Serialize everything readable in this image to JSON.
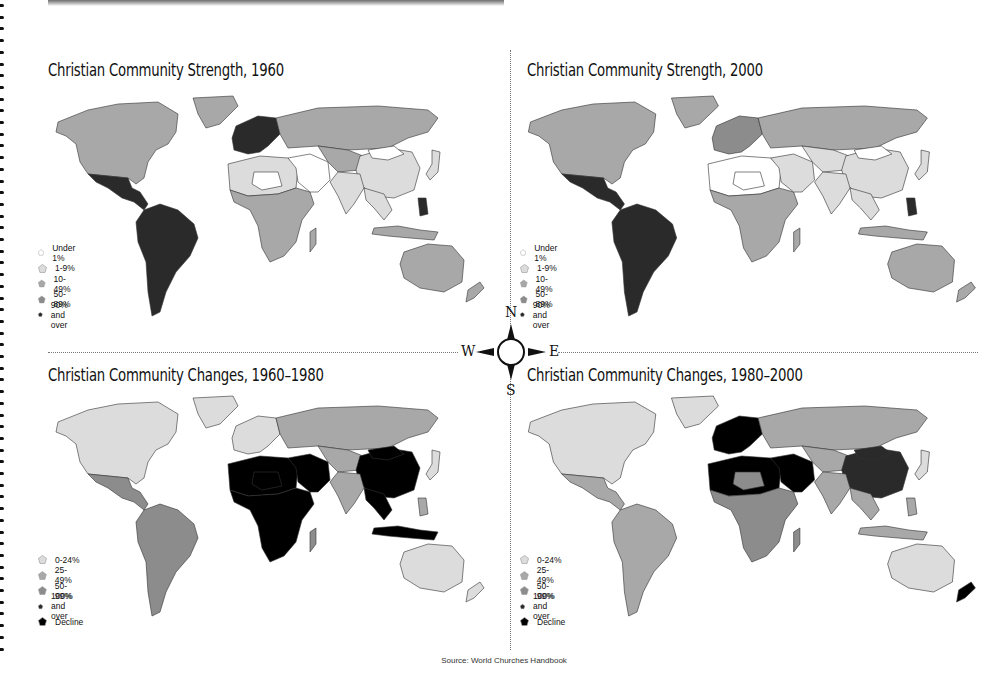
{
  "colors": {
    "under1": "#ffffff",
    "light": "#dcdcdc",
    "mid": "#a8a8a8",
    "midDark": "#8c8c8c",
    "dark": "#2a2a2a",
    "black": "#000000",
    "border": "#333333"
  },
  "panels": [
    {
      "id": "strength-1960",
      "title": "Christian Community Strength, 1960",
      "legend": [
        {
          "label": "Under 1%",
          "color": "#ffffff"
        },
        {
          "label": "1-9%",
          "color": "#dcdcdc"
        },
        {
          "label": "10-49%",
          "color": "#a8a8a8"
        },
        {
          "label": "50-89%",
          "color": "#8c8c8c"
        },
        {
          "label": "90% and over",
          "color": "#2a2a2a"
        }
      ]
    },
    {
      "id": "strength-2000",
      "title": "Christian Community Strength, 2000",
      "legend": [
        {
          "label": "Under 1%",
          "color": "#ffffff"
        },
        {
          "label": "1-9%",
          "color": "#dcdcdc"
        },
        {
          "label": "10-49%",
          "color": "#a8a8a8"
        },
        {
          "label": "50-89%",
          "color": "#8c8c8c"
        },
        {
          "label": "90% and over",
          "color": "#2a2a2a"
        }
      ]
    },
    {
      "id": "changes-1960-1980",
      "title": "Christian Community Changes, 1960–1980",
      "legend": [
        {
          "label": "0-24%",
          "color": "#dcdcdc"
        },
        {
          "label": "25-49%",
          "color": "#a8a8a8"
        },
        {
          "label": "50-99%",
          "color": "#8c8c8c"
        },
        {
          "label": "100% and over",
          "color": "#2a2a2a"
        },
        {
          "label": "Decline",
          "color": "#000000"
        }
      ]
    },
    {
      "id": "changes-1980-2000",
      "title": "Christian Community Changes, 1980–2000",
      "legend": [
        {
          "label": "0-24%",
          "color": "#dcdcdc"
        },
        {
          "label": "25-49%",
          "color": "#a8a8a8"
        },
        {
          "label": "50-99%",
          "color": "#8c8c8c"
        },
        {
          "label": "100% and over",
          "color": "#2a2a2a"
        },
        {
          "label": "Decline",
          "color": "#000000"
        }
      ]
    }
  ],
  "compass": {
    "n": "N",
    "s": "S",
    "e": "E",
    "w": "W"
  },
  "source": "Source: World Churches Handbook",
  "regions_by_panel": {
    "strength-1960": {
      "north_america": "#a8a8a8",
      "greenland": "#a8a8a8",
      "mexico_central": "#2a2a2a",
      "south_america": "#2a2a2a",
      "western_europe": "#2a2a2a",
      "russia": "#a8a8a8",
      "north_africa": "#dcdcdc",
      "sahara_center": "#ffffff",
      "sub_saharan_africa": "#a8a8a8",
      "middle_east": "#ffffff",
      "central_asia": "#a8a8a8",
      "china": "#dcdcdc",
      "mongolia": "#ffffff",
      "india": "#dcdcdc",
      "southeast_asia": "#dcdcdc",
      "indonesia": "#a8a8a8",
      "philippines": "#2a2a2a",
      "australia": "#a8a8a8",
      "new_zealand": "#a8a8a8",
      "madagascar": "#a8a8a8",
      "japan": "#dcdcdc"
    },
    "strength-2000": {
      "north_america": "#a8a8a8",
      "greenland": "#a8a8a8",
      "mexico_central": "#2a2a2a",
      "south_america": "#2a2a2a",
      "western_europe": "#8c8c8c",
      "russia": "#a8a8a8",
      "north_africa": "#ffffff",
      "sahara_center": "#ffffff",
      "sub_saharan_africa": "#a8a8a8",
      "middle_east": "#dcdcdc",
      "central_asia": "#dcdcdc",
      "china": "#dcdcdc",
      "mongolia": "#ffffff",
      "india": "#dcdcdc",
      "southeast_asia": "#dcdcdc",
      "indonesia": "#a8a8a8",
      "philippines": "#2a2a2a",
      "australia": "#a8a8a8",
      "new_zealand": "#a8a8a8",
      "madagascar": "#a8a8a8",
      "japan": "#dcdcdc"
    },
    "changes-1960-1980": {
      "north_america": "#dcdcdc",
      "greenland": "#dcdcdc",
      "mexico_central": "#8c8c8c",
      "south_america": "#8c8c8c",
      "western_europe": "#dcdcdc",
      "russia": "#a8a8a8",
      "north_africa": "#000000",
      "sahara_center": "#000000",
      "sub_saharan_africa": "#000000",
      "middle_east": "#000000",
      "central_asia": "#a8a8a8",
      "china": "#000000",
      "mongolia": "#000000",
      "india": "#a8a8a8",
      "southeast_asia": "#000000",
      "indonesia": "#000000",
      "philippines": "#a8a8a8",
      "australia": "#dcdcdc",
      "new_zealand": "#dcdcdc",
      "madagascar": "#8c8c8c",
      "japan": "#dcdcdc"
    },
    "changes-1980-2000": {
      "north_america": "#dcdcdc",
      "greenland": "#dcdcdc",
      "mexico_central": "#a8a8a8",
      "south_america": "#a8a8a8",
      "western_europe": "#000000",
      "russia": "#a8a8a8",
      "north_africa": "#000000",
      "sahara_center": "#8c8c8c",
      "sub_saharan_africa": "#8c8c8c",
      "middle_east": "#000000",
      "central_asia": "#a8a8a8",
      "china": "#2a2a2a",
      "mongolia": "#2a2a2a",
      "india": "#a8a8a8",
      "southeast_asia": "#a8a8a8",
      "indonesia": "#a8a8a8",
      "philippines": "#a8a8a8",
      "australia": "#dcdcdc",
      "new_zealand": "#000000",
      "madagascar": "#8c8c8c",
      "japan": "#dcdcdc"
    }
  }
}
